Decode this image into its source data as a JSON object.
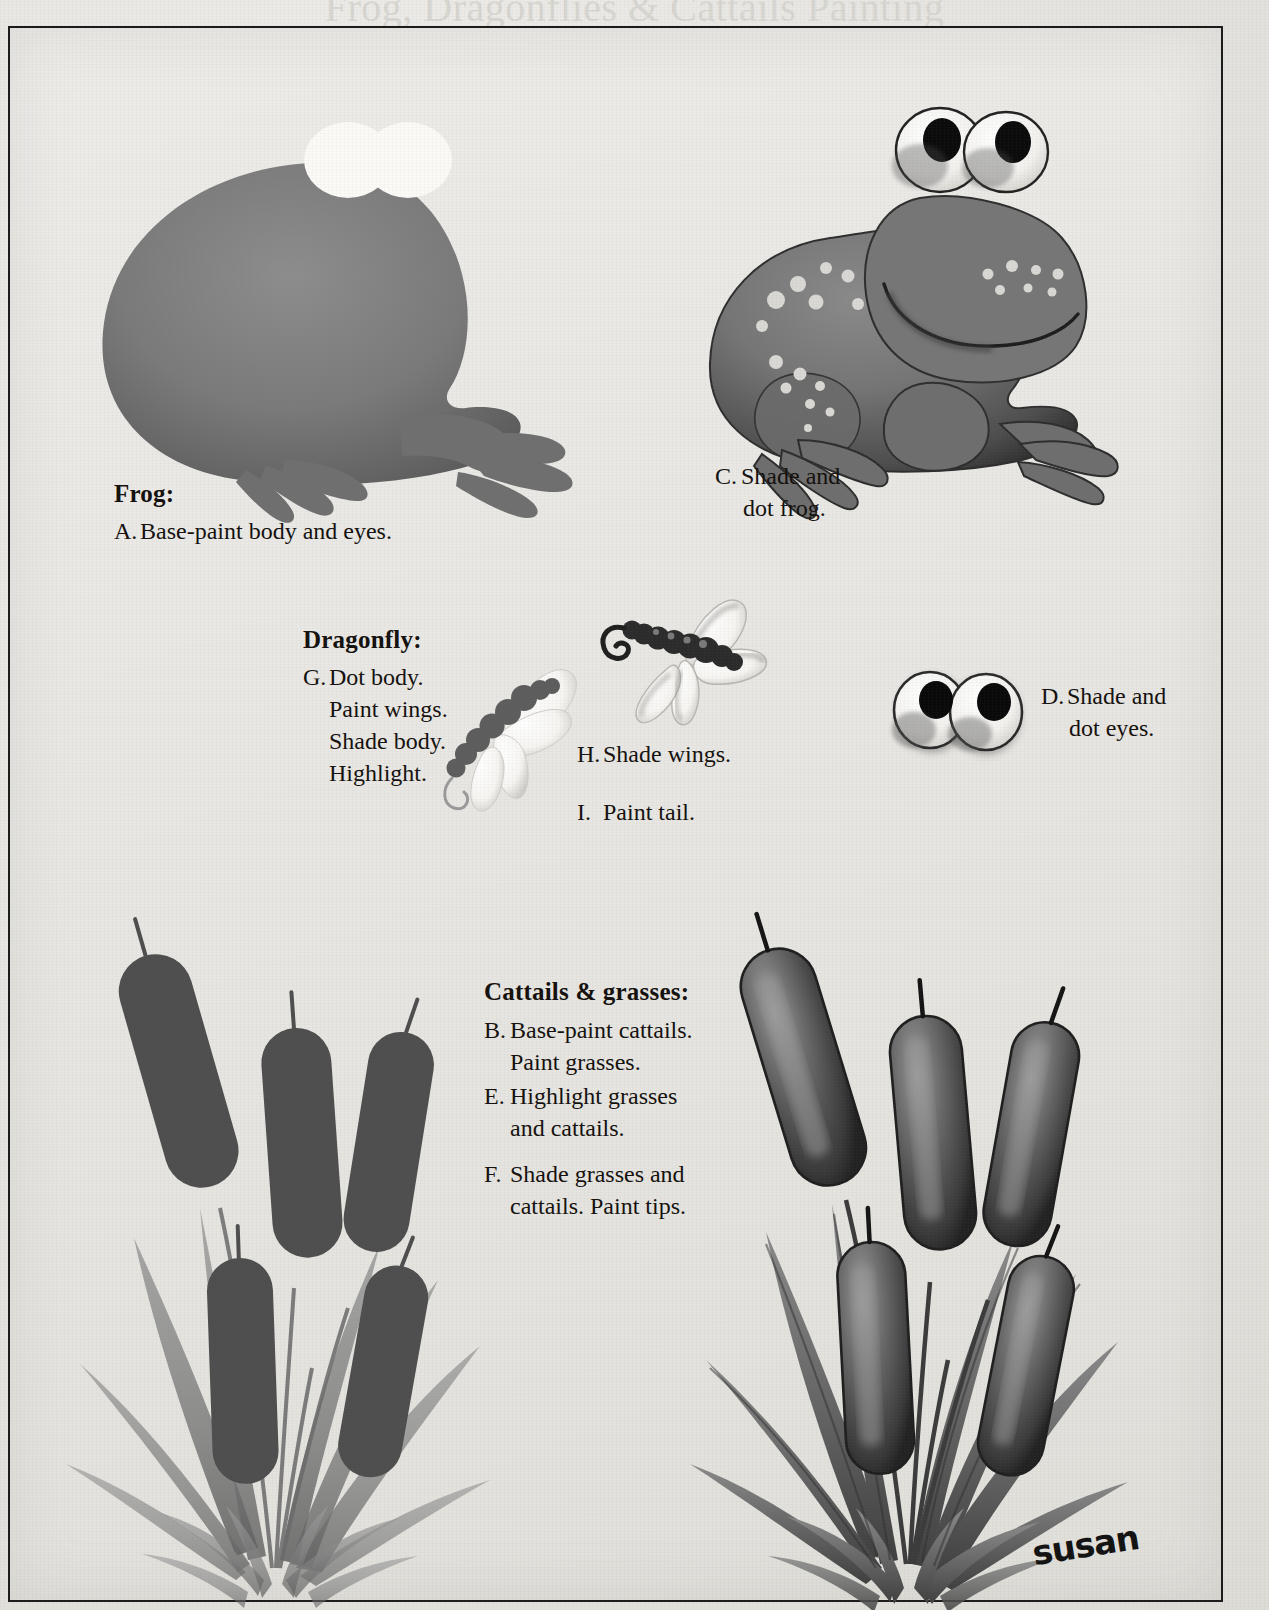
{
  "page": {
    "title": "Frog, Dragonflies & Cattails Painting",
    "signature": "susan",
    "background_color": "#e7e6e2",
    "ink_color": "#14100d",
    "frame_color": "#1a1a1a"
  },
  "sections": {
    "frog": {
      "heading": "Frog:",
      "steps": [
        {
          "letter": "A.",
          "line1": "Base-paint body and eyes.",
          "line2": ""
        },
        {
          "letter": "C.",
          "line1": "Shade and",
          "line2": "dot frog."
        },
        {
          "letter": "D.",
          "line1": "Shade and",
          "line2": "dot eyes."
        }
      ]
    },
    "dragonfly": {
      "heading": "Dragonfly:",
      "steps": [
        {
          "letter": "G.",
          "line1": "Dot body.",
          "line2": "Paint wings.",
          "line3": "Shade body.",
          "line4": "Highlight."
        },
        {
          "letter": "H.",
          "line1": "Shade wings.",
          "line2": ""
        },
        {
          "letter": "I.",
          "line1": "Paint tail.",
          "line2": ""
        }
      ]
    },
    "cattails": {
      "heading": "Cattails & grasses:",
      "steps": [
        {
          "letter": "B.",
          "line1": "Base-paint cattails.",
          "line2": "Paint grasses."
        },
        {
          "letter": "E.",
          "line1": "Highlight grasses",
          "line2": "and cattails."
        },
        {
          "letter": "F.",
          "line1": "Shade grasses and",
          "line2": "cattails. Paint tips."
        }
      ]
    }
  },
  "artwork": {
    "frog_base": {
      "name": "frog-silhouette-base",
      "caption_ref": "A."
    },
    "frog_finished": {
      "name": "frog-shaded-dotted",
      "caption_ref": "C."
    },
    "dragonfly_base": {
      "name": "dragonfly-dotted-body",
      "caption_ref": "G."
    },
    "dragonfly_finished": {
      "name": "dragonfly-shaded-wings-tail",
      "caption_ref": "H./I."
    },
    "eyes": {
      "name": "frog-eyes-pair",
      "caption_ref": "D."
    },
    "cattails_base": {
      "name": "cattails-base-paint",
      "caption_ref": "B."
    },
    "cattails_finished": {
      "name": "cattails-highlighted-shaded",
      "caption_ref": "E./F."
    }
  },
  "palette": {
    "dark_ink": "#111111",
    "mid_gray": "#6f6f6f",
    "body_gray": "#7b7b7b",
    "shade_gray": "#4a4a4a",
    "highlight": "#f4f3f0",
    "paper": "#e7e6e2"
  }
}
